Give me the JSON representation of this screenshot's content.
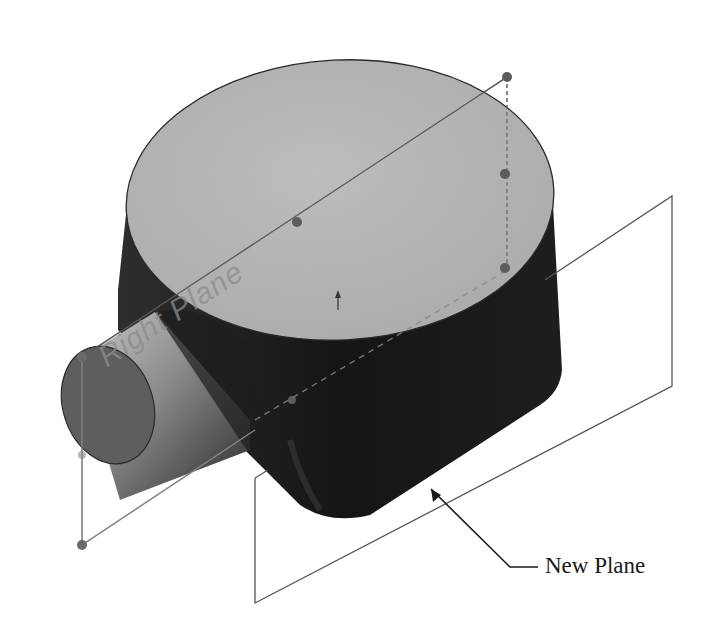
{
  "figure": {
    "type": "3D CAD model with reference planes",
    "labels": {
      "right_plane": "Right Plane",
      "new_plane_callout": "New Plane"
    },
    "colors": {
      "background": "#ffffff",
      "top_face": "#b4b4b4",
      "body_dark": "#1c1c1c",
      "boss_light": "#9a9a9a",
      "boss_end_face": "#5a5a5a",
      "plane_edge": "#555555",
      "handle_dot": "#5c5c5c",
      "leader_line": "#1a1a1a"
    }
  }
}
